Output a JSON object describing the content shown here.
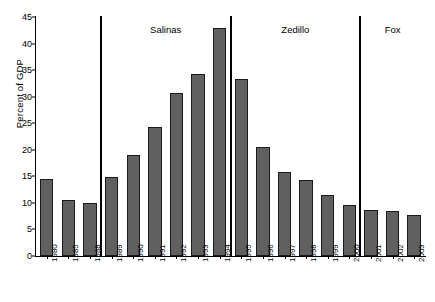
{
  "chart_data": {
    "type": "bar",
    "title": "",
    "xlabel": "",
    "ylabel": "Percent of GDP",
    "ylim": [
      0,
      45
    ],
    "ytick_labels": [
      "0",
      "5",
      "10",
      "15",
      "20",
      "25",
      "30",
      "35",
      "40",
      "45"
    ],
    "ytick_values": [
      0,
      5,
      10,
      15,
      20,
      25,
      30,
      35,
      40,
      45
    ],
    "grid": false,
    "legend": "none",
    "bar_color": "#606060",
    "bar_edge_color": "#1a1a1a",
    "categories": [
      "1980",
      "1985",
      "1988",
      "1989",
      "1990",
      "1991",
      "1992",
      "1993",
      "1994",
      "1995",
      "1996",
      "1997",
      "1998",
      "1999",
      "2000",
      "2001",
      "2002",
      "2003"
    ],
    "values": [
      14.5,
      10.5,
      9.9,
      14.8,
      19.1,
      24.2,
      30.7,
      34.2,
      43.0,
      33.4,
      20.6,
      15.8,
      14.3,
      11.4,
      9.6,
      8.6,
      8.4,
      7.8
    ],
    "annotations": [
      {
        "label": "Salinas",
        "after_category": "1988",
        "center_between": [
          "1989",
          "1994"
        ]
      },
      {
        "label": "Zedillo",
        "after_category": "1994",
        "center_between": [
          "1995",
          "2000"
        ]
      },
      {
        "label": "Fox",
        "after_category": "2000",
        "center_between": [
          "2001",
          "2003"
        ]
      }
    ],
    "dividers": [
      {
        "name": "salinas-start-divider",
        "after_category": "1988"
      },
      {
        "name": "zedillo-start-divider",
        "after_category": "1994"
      },
      {
        "name": "fox-start-divider",
        "after_category": "2000"
      }
    ]
  }
}
